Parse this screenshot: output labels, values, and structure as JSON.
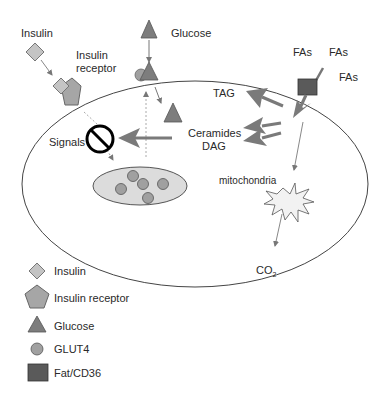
{
  "labels": {
    "insulin": "Insulin",
    "insulin_receptor_line1": "Insulin",
    "insulin_receptor_line2": "receptor",
    "glucose": "Glucose",
    "fas_1": "FAs",
    "fas_2": "FAs",
    "fas_3": "FAs",
    "tag": "TAG",
    "ceramides": "Ceramides",
    "dag": "DAG",
    "signals": "Signals",
    "mitochondria": "mitochondria",
    "co2_main": "CO",
    "co2_sub": "2"
  },
  "legend": {
    "items": [
      {
        "shape": "diamond",
        "label": "Insulin"
      },
      {
        "shape": "pentagon",
        "label": "Insulin receptor"
      },
      {
        "shape": "triangle",
        "label": "Glucose"
      },
      {
        "shape": "circle",
        "label": "GLUT4"
      },
      {
        "shape": "square",
        "label": "Fat/CD36"
      }
    ]
  },
  "colors": {
    "insulin": "#c4c4c4",
    "receptor": "#a6a6a6",
    "glucose": "#7d7d7d",
    "glut4": "#a0a0a0",
    "cd36": "#5a5a5a",
    "vesicle": "#dcdcdc",
    "arrow_big": "#7a7a7a",
    "line": "#555555",
    "mito": "#f2f2f2"
  }
}
